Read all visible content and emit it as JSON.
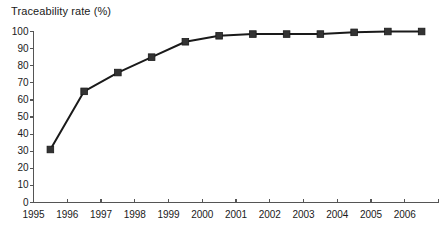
{
  "chart_data": {
    "type": "line",
    "title": "Traceability rate (%)",
    "xlabel": "",
    "ylabel": "",
    "x": [
      1995.5,
      1996.5,
      1997.5,
      1998.5,
      1999.5,
      2000.5,
      2001.5,
      2002.5,
      2003.5,
      2004.5,
      2005.5,
      2006.5
    ],
    "values": [
      31,
      65,
      76,
      85,
      94,
      97.5,
      98.5,
      98.5,
      98.5,
      99.5,
      100,
      100
    ],
    "series": [
      {
        "name": "Traceability rate",
        "values": [
          31,
          65,
          76,
          85,
          94,
          97.5,
          98.5,
          98.5,
          98.5,
          99.5,
          100,
          100
        ]
      }
    ],
    "xlim": [
      1995,
      2007
    ],
    "ylim": [
      0,
      100
    ],
    "x_tick_labels": [
      "1995",
      "1996",
      "1997",
      "1998",
      "1999",
      "2000",
      "2001",
      "2002",
      "2003",
      "2004",
      "2005",
      "2006"
    ],
    "x_tick_values": [
      1995,
      1996,
      1997,
      1998,
      1999,
      2000,
      2001,
      2002,
      2003,
      2004,
      2005,
      2006
    ],
    "y_tick_labels": [
      "0",
      "10",
      "20",
      "30",
      "40",
      "50",
      "60",
      "70",
      "80",
      "90",
      "100"
    ],
    "y_tick_values": [
      0,
      10,
      20,
      30,
      40,
      50,
      60,
      70,
      80,
      90,
      100
    ],
    "grid": false,
    "legend": false,
    "legend_position": "none",
    "marker": "square",
    "line_color": "#1a1a1a",
    "marker_color": "#333333",
    "axis_color": "#555555",
    "background_color": "#ffffff"
  },
  "caption": {
    "text": ""
  }
}
